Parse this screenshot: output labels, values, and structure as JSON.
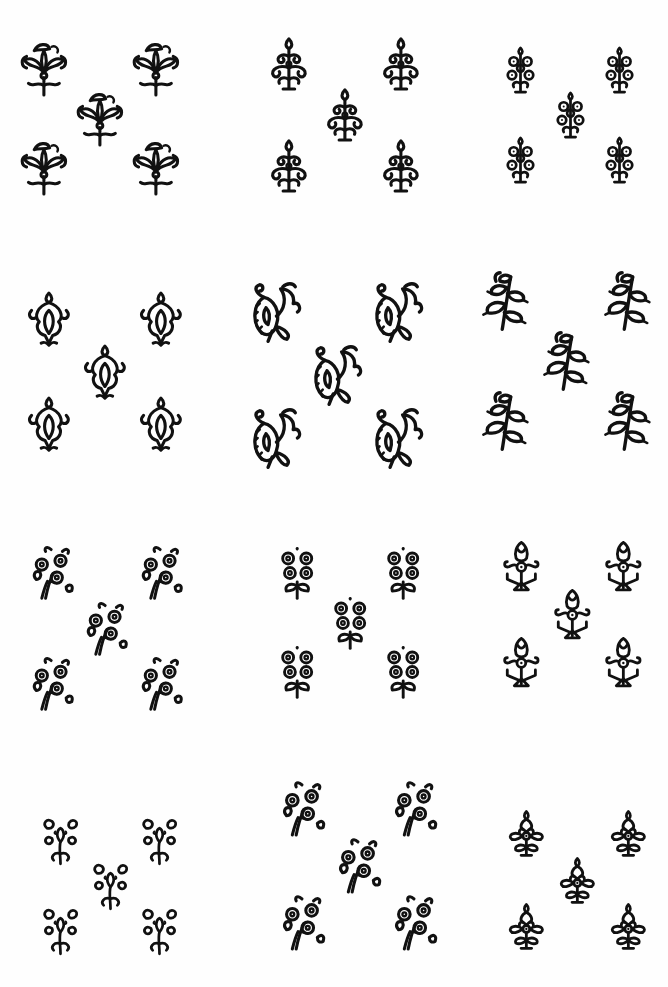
{
  "sheet": {
    "title": "",
    "background": "#fefefe",
    "ink_color": "#111111",
    "layout": "4 rows x 3 columns of motif groups, 5 motifs per group in quincunx arrangement"
  },
  "groups": [
    {
      "id": "g1",
      "row": 1,
      "col": 1,
      "style": "lotus-bouquet",
      "x": 15,
      "y": 35,
      "w": 170,
      "h": 165
    },
    {
      "id": "g2",
      "row": 1,
      "col": 2,
      "style": "flame-tree",
      "x": 260,
      "y": 30,
      "w": 170,
      "h": 170
    },
    {
      "id": "g3",
      "row": 1,
      "col": 3,
      "style": "dotted-flower-spray",
      "x": 495,
      "y": 40,
      "w": 150,
      "h": 150
    },
    {
      "id": "g4",
      "row": 2,
      "col": 1,
      "style": "mughal-buta",
      "x": 20,
      "y": 285,
      "w": 170,
      "h": 175
    },
    {
      "id": "g5",
      "row": 2,
      "col": 2,
      "style": "paisley-spray",
      "x": 245,
      "y": 270,
      "w": 185,
      "h": 210
    },
    {
      "id": "g6",
      "row": 2,
      "col": 3,
      "style": "leafy-spray",
      "x": 475,
      "y": 260,
      "w": 185,
      "h": 200
    },
    {
      "id": "g7",
      "row": 3,
      "col": 1,
      "style": "rosette-vine",
      "x": 25,
      "y": 535,
      "w": 165,
      "h": 185
    },
    {
      "id": "g8",
      "row": 3,
      "col": 2,
      "style": "rosette-cluster",
      "x": 270,
      "y": 540,
      "w": 160,
      "h": 165
    },
    {
      "id": "g9",
      "row": 3,
      "col": 3,
      "style": "geometric-tree",
      "x": 495,
      "y": 535,
      "w": 155,
      "h": 160
    },
    {
      "id": "g10",
      "row": 4,
      "col": 1,
      "style": "scroll-blossom",
      "x": 35,
      "y": 810,
      "w": 150,
      "h": 150
    },
    {
      "id": "g11",
      "row": 4,
      "col": 2,
      "style": "rosette-vine",
      "x": 275,
      "y": 770,
      "w": 170,
      "h": 190
    },
    {
      "id": "g12",
      "row": 4,
      "col": 3,
      "style": "diamond-tree",
      "x": 500,
      "y": 805,
      "w": 155,
      "h": 155
    }
  ],
  "quincunx": [
    {
      "pos": "top-left",
      "fx": 0.0,
      "fy": 0.0
    },
    {
      "pos": "top-right",
      "fx": 0.66,
      "fy": 0.0
    },
    {
      "pos": "center",
      "fx": 0.33,
      "fy": 0.3
    },
    {
      "pos": "bottom-left",
      "fx": 0.0,
      "fy": 0.6
    },
    {
      "pos": "bottom-right",
      "fx": 0.66,
      "fy": 0.6
    }
  ]
}
